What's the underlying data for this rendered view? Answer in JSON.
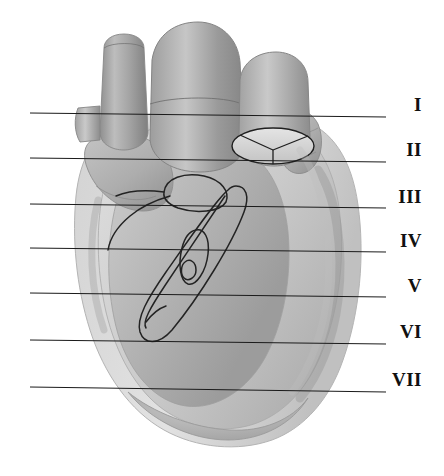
{
  "figure": {
    "type": "grayscale-anatomical-illustration",
    "width": 444,
    "height": 476,
    "background_color": "#ffffff"
  },
  "section_lines": {
    "line_color": "#1a1a1a",
    "line_width": 1,
    "x_start": 30,
    "x_end": 386,
    "items": [
      {
        "label": "I",
        "y_left": 113,
        "y_right": 117,
        "label_x": 422,
        "label_y": 95
      },
      {
        "label": "II",
        "y_left": 158,
        "y_right": 162,
        "label_x": 422,
        "label_y": 140
      },
      {
        "label": "III",
        "y_left": 204,
        "y_right": 208,
        "label_x": 422,
        "label_y": 187
      },
      {
        "label": "IV",
        "y_left": 248,
        "y_right": 252,
        "label_x": 422,
        "label_y": 231
      },
      {
        "label": "V",
        "y_left": 293,
        "y_right": 297,
        "label_x": 422,
        "label_y": 276
      },
      {
        "label": "VI",
        "y_left": 340,
        "y_right": 344,
        "label_x": 422,
        "label_y": 322
      },
      {
        "label": "VII",
        "y_left": 387,
        "y_right": 392,
        "label_x": 422,
        "label_y": 370
      }
    ]
  },
  "structures": {
    "palette": {
      "outline": "#2a2a2a",
      "vessel_dark": "#8e8e8e",
      "vessel_mid": "#a6a6a6",
      "vessel_light": "#c2c2c2",
      "chamber_mid": "#b0b0b0",
      "chamber_light": "#cfcfcf",
      "chamber_pale": "#dedede",
      "highlight": "#ececec",
      "shadow": "#7d7d7d"
    },
    "parts": [
      {
        "name": "superior-vena-cava",
        "shade": "vessel_dark"
      },
      {
        "name": "aorta",
        "shade": "vessel_mid"
      },
      {
        "name": "pulmonary-trunk",
        "shade": "vessel_dark"
      },
      {
        "name": "aortic-valve-cusps",
        "shade": "chamber_light"
      },
      {
        "name": "right-auricle",
        "shade": "chamber_mid"
      },
      {
        "name": "left-auricle",
        "shade": "chamber_mid"
      },
      {
        "name": "right-ventricle",
        "shade": "chamber_light"
      },
      {
        "name": "left-ventricle",
        "shade": "chamber_pale"
      },
      {
        "name": "anterior-interventricular-groove",
        "shade": "outline"
      },
      {
        "name": "coronary-artery-outline",
        "shade": "outline"
      },
      {
        "name": "cardiac-apex",
        "shade": "chamber_mid"
      }
    ]
  }
}
